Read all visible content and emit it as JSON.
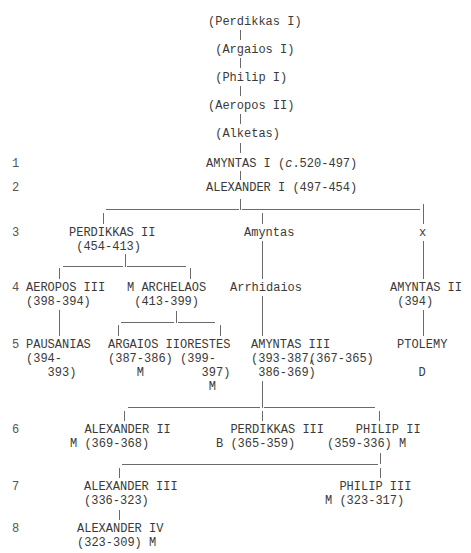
{
  "generations": [
    {
      "label": "1",
      "x": 12,
      "y": 157
    },
    {
      "label": "2",
      "x": 12,
      "y": 181
    },
    {
      "label": "3",
      "x": 12,
      "y": 226
    },
    {
      "label": "4",
      "x": 12,
      "y": 281
    },
    {
      "label": "5",
      "x": 12,
      "y": 338
    },
    {
      "label": "6",
      "x": 12,
      "y": 423
    },
    {
      "label": "7",
      "x": 12,
      "y": 480
    },
    {
      "label": "8",
      "x": 12,
      "y": 522
    }
  ],
  "nodes": [
    {
      "id": "perdikkas-i",
      "lines": [
        "(Perdikkas I)"
      ],
      "x": 208,
      "y": 15
    },
    {
      "id": "argaios-i",
      "lines": [
        " (Argaios I)"
      ],
      "x": 208,
      "y": 43
    },
    {
      "id": "philip-i",
      "lines": [
        " (Philip I)"
      ],
      "x": 208,
      "y": 71
    },
    {
      "id": "aeropos-ii",
      "lines": [
        "(Aeropos II)"
      ],
      "x": 208,
      "y": 99
    },
    {
      "id": "alketas",
      "lines": [
        " (Alketas)"
      ],
      "x": 208,
      "y": 127
    },
    {
      "id": "amyntas-i",
      "lines": [
        "AMYNTAS I (c.520-497)"
      ],
      "x": 206,
      "y": 157
    },
    {
      "id": "alexander-i",
      "lines": [
        "ALEXANDER I (497-454)"
      ],
      "x": 206,
      "y": 181
    },
    {
      "id": "perdikkas-ii",
      "lines": [
        "PERDIKKAS II",
        " (454-413)"
      ],
      "x": 69,
      "y": 226
    },
    {
      "id": "amyntas",
      "lines": [
        "Amyntas"
      ],
      "x": 244,
      "y": 226
    },
    {
      "id": "x",
      "lines": [
        "x"
      ],
      "x": 419,
      "y": 226
    },
    {
      "id": "aeropos-iii",
      "lines": [
        "AEROPOS III",
        "(398-394)"
      ],
      "x": 26,
      "y": 281
    },
    {
      "id": "archelaos",
      "lines": [
        "M ARCHELAOS",
        " (413-399)"
      ],
      "x": 127,
      "y": 281
    },
    {
      "id": "arrhidaios",
      "lines": [
        "Arrhidaios"
      ],
      "x": 230,
      "y": 281
    },
    {
      "id": "amyntas-ii",
      "lines": [
        "AMYNTAS II",
        " (394)"
      ],
      "x": 390,
      "y": 281
    },
    {
      "id": "pausanias",
      "lines": [
        "PAUSANIAS",
        "(394-",
        "   393)"
      ],
      "x": 26,
      "y": 338
    },
    {
      "id": "argaios-ii",
      "lines": [
        "ARGAIOS II",
        "(387-386)",
        "    M"
      ],
      "x": 108,
      "y": 338
    },
    {
      "id": "orestes",
      "lines": [
        "ORESTES",
        "(399-",
        "   397)",
        "    M"
      ],
      "x": 180,
      "y": 338
    },
    {
      "id": "amyntas-iii",
      "lines": [
        "AMYNTAS III",
        "(393-387,",
        " 386-369)"
      ],
      "x": 251,
      "y": 338
    },
    {
      "id": "amyntas-iii-reign2",
      "lines": [
        "(367-365)"
      ],
      "x": 309,
      "y": 352
    },
    {
      "id": "ptolemy",
      "lines": [
        "PTOLEMY",
        "",
        "   D"
      ],
      "x": 397,
      "y": 338
    },
    {
      "id": "alexander-ii",
      "lines": [
        "  ALEXANDER II",
        "M (369-368)"
      ],
      "x": 70,
      "y": 423
    },
    {
      "id": "perdikkas-iii",
      "lines": [
        "  PERDIKKAS III",
        "B (365-359)"
      ],
      "x": 216,
      "y": 423
    },
    {
      "id": "philip-ii",
      "lines": [
        "    PHILIP II",
        "(359-336) M"
      ],
      "x": 327,
      "y": 423
    },
    {
      "id": "alexander-iii",
      "lines": [
        "ALEXANDER III",
        "(336-323)"
      ],
      "x": 84,
      "y": 480
    },
    {
      "id": "philip-iii",
      "lines": [
        "  PHILIP III",
        "M (323-317)"
      ],
      "x": 325,
      "y": 480
    },
    {
      "id": "alexander-iv",
      "lines": [
        "ALEXANDER IV",
        "(323-309) M"
      ],
      "x": 77,
      "y": 522
    }
  ],
  "vertical_lines": [
    {
      "x": 240,
      "y1": 30,
      "y2": 40
    },
    {
      "x": 240,
      "y1": 58,
      "y2": 68
    },
    {
      "x": 240,
      "y1": 86,
      "y2": 96
    },
    {
      "x": 240,
      "y1": 114,
      "y2": 124
    },
    {
      "x": 240,
      "y1": 143,
      "y2": 153
    },
    {
      "x": 240,
      "y1": 171,
      "y2": 180
    },
    {
      "x": 240,
      "y1": 199,
      "y2": 210
    },
    {
      "x": 103,
      "y1": 213,
      "y2": 224
    },
    {
      "x": 262,
      "y1": 213,
      "y2": 224
    },
    {
      "x": 423,
      "y1": 204,
      "y2": 224
    },
    {
      "x": 262,
      "y1": 241,
      "y2": 279
    },
    {
      "x": 423,
      "y1": 241,
      "y2": 279
    },
    {
      "x": 125,
      "y1": 254,
      "y2": 267
    },
    {
      "x": 59,
      "y1": 268,
      "y2": 279
    },
    {
      "x": 190,
      "y1": 268,
      "y2": 279
    },
    {
      "x": 59,
      "y1": 310,
      "y2": 336
    },
    {
      "x": 423,
      "y1": 310,
      "y2": 336
    },
    {
      "x": 262,
      "y1": 296,
      "y2": 336
    },
    {
      "x": 176,
      "y1": 311,
      "y2": 323
    },
    {
      "x": 118,
      "y1": 325,
      "y2": 336
    },
    {
      "x": 220,
      "y1": 325,
      "y2": 336
    },
    {
      "x": 262,
      "y1": 381,
      "y2": 408
    },
    {
      "x": 124,
      "y1": 411,
      "y2": 421
    },
    {
      "x": 262,
      "y1": 411,
      "y2": 421
    },
    {
      "x": 379,
      "y1": 411,
      "y2": 421
    },
    {
      "x": 380,
      "y1": 453,
      "y2": 464
    },
    {
      "x": 119,
      "y1": 468,
      "y2": 478
    },
    {
      "x": 380,
      "y1": 468,
      "y2": 478
    },
    {
      "x": 119,
      "y1": 510,
      "y2": 520
    }
  ],
  "horizontal_lines": [
    {
      "x1": 106,
      "x2": 239,
      "y": 209
    },
    {
      "x1": 242,
      "x2": 420,
      "y": 209
    },
    {
      "x1": 63,
      "x2": 123,
      "y": 266
    },
    {
      "x1": 127,
      "x2": 186,
      "y": 266
    },
    {
      "x1": 121,
      "x2": 174,
      "y": 322
    },
    {
      "x1": 178,
      "x2": 215,
      "y": 322
    },
    {
      "x1": 128,
      "x2": 260,
      "y": 407
    },
    {
      "x1": 264,
      "x2": 375,
      "y": 407
    },
    {
      "x1": 122,
      "x2": 378,
      "y": 464
    }
  ]
}
